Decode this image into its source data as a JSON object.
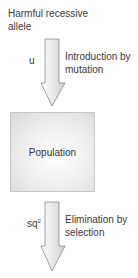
{
  "diagram": {
    "source": {
      "line1": "Harmful recessive",
      "line2": "allele"
    },
    "input_arrow": {
      "rate_label": "u",
      "desc_line1": "Introduction by",
      "desc_line2": "mutation"
    },
    "node": {
      "label": "Population"
    },
    "output_arrow": {
      "rate_base": "sq",
      "rate_exp": "2",
      "desc_line1": "Elimination by",
      "desc_line2": "selection"
    },
    "colors": {
      "arrow_fill": "#d9d9d9",
      "arrow_stroke": "#8a8a8a",
      "box_border": "#c8c8c8",
      "text": "#3a3a3a"
    }
  }
}
